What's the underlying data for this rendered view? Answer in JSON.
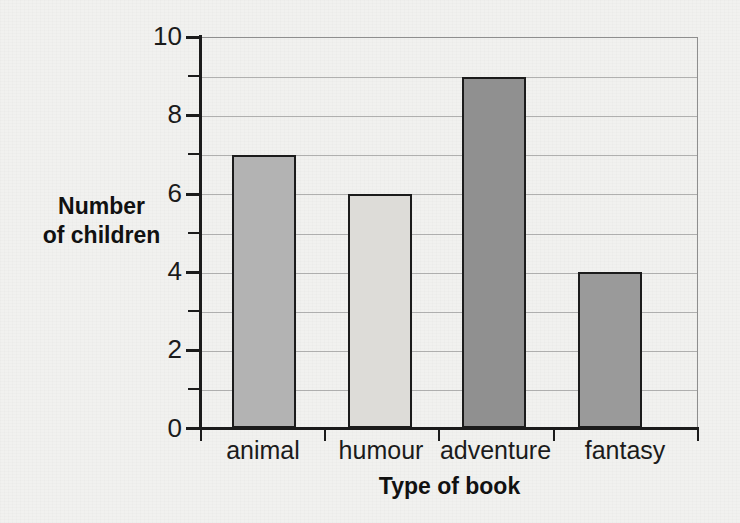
{
  "chart_data": {
    "type": "bar",
    "title": "",
    "categories": [
      "animal",
      "humour",
      "adventure",
      "fantasy"
    ],
    "values": [
      7,
      6,
      9,
      4
    ],
    "series": [
      {
        "name": "Number of children",
        "values": [
          7,
          6,
          9,
          4
        ]
      }
    ],
    "xlabel": "Type of book",
    "ylabel": "Number of children",
    "ylabel_line1": "Number",
    "ylabel_line2": "of children",
    "ylim": [
      0,
      10
    ],
    "ytick_labels": [
      "0",
      "2",
      "4",
      "6",
      "8",
      "10"
    ],
    "ytick_values": [
      0,
      2,
      4,
      6,
      8,
      10
    ],
    "minor_tick_values": [
      1,
      3,
      5,
      7,
      9
    ],
    "gridlines": [
      1,
      2,
      3,
      4,
      5,
      6,
      7,
      8,
      9
    ],
    "grid": true,
    "legend": "none",
    "bar_colors": [
      "#b3b3b3",
      "#dddcd8",
      "#909090",
      "#9a9a9a"
    ],
    "bar_edge_color": "#1b1b1b",
    "axis_color": "#1b1b1b",
    "grid_color": "#9a9a9a",
    "background_color": "#f1f1ef"
  }
}
